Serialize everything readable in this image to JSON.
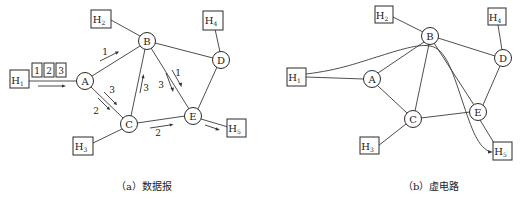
{
  "figures": [
    {
      "id": "datagram",
      "caption": "（a）数据报",
      "routers": [
        "A",
        "B",
        "C",
        "D",
        "E"
      ],
      "hosts": [
        "H1",
        "H2",
        "H3",
        "H4",
        "H5"
      ],
      "links": [
        [
          "H1",
          "A"
        ],
        [
          "H2",
          "B"
        ],
        [
          "H3",
          "C"
        ],
        [
          "H4",
          "D"
        ],
        [
          "H5",
          "E"
        ],
        [
          "A",
          "B"
        ],
        [
          "A",
          "C"
        ],
        [
          "B",
          "C"
        ],
        [
          "B",
          "D"
        ],
        [
          "B",
          "E"
        ],
        [
          "C",
          "E"
        ],
        [
          "D",
          "E"
        ]
      ],
      "packets": [
        "1",
        "2",
        "3"
      ],
      "packet_arrows": [
        {
          "label": "1",
          "route": "A→B"
        },
        {
          "label": "3",
          "route": "A→C"
        },
        {
          "label": "2",
          "route": "A→C"
        },
        {
          "label": "3",
          "route": "C→B"
        },
        {
          "label": "3",
          "route": "B→E"
        },
        {
          "label": "1",
          "route": "B→E"
        },
        {
          "label": "2",
          "route": "C→E"
        },
        {
          "label": "",
          "route": "H1→A"
        },
        {
          "label": "",
          "route": "E→H5"
        }
      ]
    },
    {
      "id": "virtual-circuit",
      "caption": "（b）虚电路",
      "routers": [
        "A",
        "B",
        "C",
        "D",
        "E"
      ],
      "hosts": [
        "H1",
        "H2",
        "H3",
        "H4",
        "H5"
      ],
      "links": [
        [
          "H1",
          "A"
        ],
        [
          "H2",
          "B"
        ],
        [
          "H3",
          "C"
        ],
        [
          "H4",
          "D"
        ],
        [
          "H5",
          "E"
        ],
        [
          "A",
          "B"
        ],
        [
          "A",
          "C"
        ],
        [
          "B",
          "C"
        ],
        [
          "B",
          "D"
        ],
        [
          "B",
          "E"
        ],
        [
          "C",
          "E"
        ],
        [
          "D",
          "E"
        ]
      ],
      "virtual_circuit_path": [
        "H1",
        "B",
        "H5"
      ]
    }
  ],
  "labels": {
    "A": "A",
    "B": "B",
    "C": "C",
    "D": "D",
    "E": "E",
    "H": "H",
    "s1": "1",
    "s2": "2",
    "s3": "3",
    "s4": "4",
    "s5": "5"
  }
}
